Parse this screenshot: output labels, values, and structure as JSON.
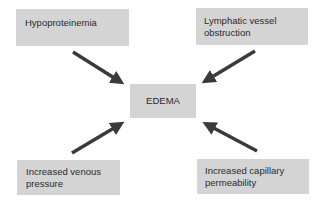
{
  "diagram": {
    "center": {
      "label": "EDEMA"
    },
    "causes": [
      {
        "id": "top-left",
        "lines": [
          "Hypoproteinemia"
        ]
      },
      {
        "id": "top-right",
        "lines": [
          "Lymphatic vessel",
          "obstruction"
        ]
      },
      {
        "id": "bottom-left",
        "lines": [
          "Increased venous",
          "pressure"
        ]
      },
      {
        "id": "bottom-right",
        "lines": [
          "Increased capillary",
          "permeability"
        ]
      }
    ],
    "colors": {
      "box_fill": "#d4d4d4",
      "arrow": "#3a3a3a",
      "text": "#2a2a2a",
      "background": "#ffffff"
    }
  }
}
